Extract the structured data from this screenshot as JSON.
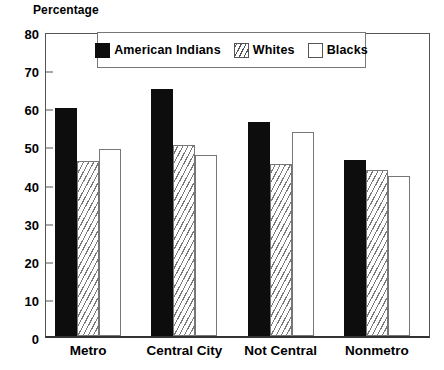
{
  "chart_data": {
    "type": "bar",
    "title": "",
    "ylabel": "Percentage",
    "xlabel": "",
    "ylim": [
      0,
      80
    ],
    "yticks": [
      0,
      10,
      20,
      30,
      40,
      50,
      60,
      70,
      80
    ],
    "grid": false,
    "legend_position": "top-center",
    "categories": [
      "Metro",
      "Central City",
      "Not Central",
      "Nonmetro"
    ],
    "series": [
      {
        "name": "American Indians",
        "fill": "solid-black",
        "color": "#0d0d0d",
        "values": [
          59.8,
          64.8,
          56.2,
          46.2
        ]
      },
      {
        "name": "Whites",
        "fill": "diagonal-hatch",
        "color": "#ffffff",
        "values": [
          46.0,
          50.0,
          45.0,
          43.5
        ]
      },
      {
        "name": "Blacks",
        "fill": "open-white",
        "color": "#ffffff",
        "values": [
          49.0,
          47.5,
          53.5,
          42.0
        ]
      }
    ]
  }
}
